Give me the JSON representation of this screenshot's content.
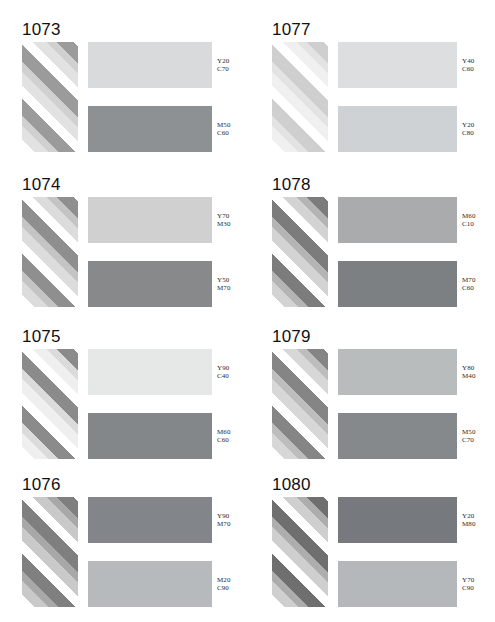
{
  "page": {
    "background": "#ffffff",
    "title_font_color": "#111111",
    "label_font_color": "#2b2b2b",
    "columns": 2,
    "rows": 4
  },
  "stripe_palette": {
    "white": "#ffffff",
    "note": "45-degree diagonal bands running bottom-left to top-right"
  },
  "panels": [
    {
      "id": "1073",
      "title": "1073",
      "stripes": {
        "light": "#e2e2e2",
        "mid": "#d0d0d0",
        "dark": "#9b9b9b",
        "white": "#ffffff"
      },
      "top": {
        "color": "#d9dadb",
        "label_line1": "Y20",
        "label_line2": "C70"
      },
      "bottom": {
        "color": "#8e9193",
        "label_line1": "M50",
        "label_line2": "C60"
      }
    },
    {
      "id": "1077",
      "title": "1077",
      "stripes": {
        "light": "#f0f0f0",
        "mid": "#e3e3e3",
        "dark": "#cfcfcf",
        "white": "#ffffff"
      },
      "top": {
        "color": "#dcdedf",
        "label_line1": "Y40",
        "label_line2": "C60"
      },
      "bottom": {
        "color": "#cfd2d4",
        "label_line1": "Y20",
        "label_line2": "C80"
      }
    },
    {
      "id": "1074",
      "title": "1074",
      "stripes": {
        "light": "#dcdcdc",
        "mid": "#c4c4c4",
        "dark": "#8f8f8f",
        "white": "#ffffff"
      },
      "top": {
        "color": "#cfd0cf",
        "label_line1": "Y70",
        "label_line2": "M30"
      },
      "bottom": {
        "color": "#87898a",
        "label_line1": "Y50",
        "label_line2": "M70"
      }
    },
    {
      "id": "1078",
      "title": "1078",
      "stripes": {
        "light": "#d3d3d3",
        "mid": "#b4b4b4",
        "dark": "#7c7c7c",
        "white": "#ffffff"
      },
      "top": {
        "color": "#a9abad",
        "label_line1": "M60",
        "label_line2": "C10"
      },
      "bottom": {
        "color": "#7d8083",
        "label_line1": "M70",
        "label_line2": "C60"
      }
    },
    {
      "id": "1075",
      "title": "1075",
      "stripes": {
        "light": "#efefef",
        "mid": "#dbdbdb",
        "dark": "#8b8b8b",
        "white": "#ffffff"
      },
      "top": {
        "color": "#e6e8e8",
        "label_line1": "Y90",
        "label_line2": "C40"
      },
      "bottom": {
        "color": "#848789",
        "label_line1": "M60",
        "label_line2": "C60"
      }
    },
    {
      "id": "1079",
      "title": "1079",
      "stripes": {
        "light": "#d7d7d7",
        "mid": "#bdbdbd",
        "dark": "#858585",
        "white": "#ffffff"
      },
      "top": {
        "color": "#b9bcbd",
        "label_line1": "Y80",
        "label_line2": "M40"
      },
      "bottom": {
        "color": "#86898b",
        "label_line1": "M50",
        "label_line2": "C70"
      }
    },
    {
      "id": "1076",
      "title": "1076",
      "stripes": {
        "light": "#c9c9c9",
        "mid": "#a8a8a8",
        "dark": "#7f7f7f",
        "white": "#ffffff"
      },
      "top": {
        "color": "#82858a",
        "label_line1": "Y90",
        "label_line2": "M70"
      },
      "bottom": {
        "color": "#b7babd",
        "label_line1": "M20",
        "label_line2": "C90"
      }
    },
    {
      "id": "1080",
      "title": "1080",
      "stripes": {
        "light": "#cfcfcf",
        "mid": "#adadad",
        "dark": "#6f6f6f",
        "white": "#ffffff"
      },
      "top": {
        "color": "#76797d",
        "label_line1": "Y20",
        "label_line2": "M80"
      },
      "bottom": {
        "color": "#b5b8ba",
        "label_line1": "Y70",
        "label_line2": "C90"
      }
    }
  ]
}
